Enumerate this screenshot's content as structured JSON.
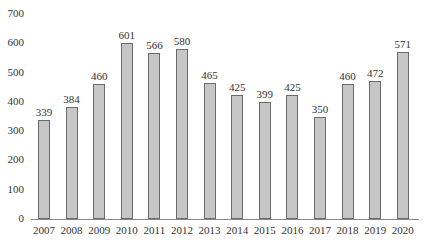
{
  "chart_data": {
    "type": "bar",
    "title": "",
    "xlabel": "",
    "ylabel": "",
    "categories": [
      "2007",
      "2008",
      "2009",
      "2010",
      "2011",
      "2012",
      "2013",
      "2014",
      "2015",
      "2016",
      "2017",
      "2018",
      "2019",
      "2020"
    ],
    "values": [
      339,
      384,
      460,
      601,
      566,
      580,
      465,
      425,
      399,
      425,
      350,
      460,
      472,
      571
    ],
    "data_labels": [
      "339",
      "384",
      "460",
      "601",
      "566",
      "580",
      "465",
      "425",
      "399",
      "425",
      "350",
      "460",
      "472",
      "571"
    ],
    "ylim": [
      0,
      700
    ],
    "yticks": [
      0,
      100,
      200,
      300,
      400,
      500,
      600,
      700
    ],
    "ytick_labels": [
      "0",
      "100",
      "200",
      "300",
      "400",
      "500",
      "600",
      "700"
    ],
    "grid": false,
    "legend": null,
    "colors": {
      "bar_fill": "#c6c6c6",
      "bar_edge": "#6a6a6a",
      "axis": "#888888",
      "text": "#333333"
    }
  }
}
